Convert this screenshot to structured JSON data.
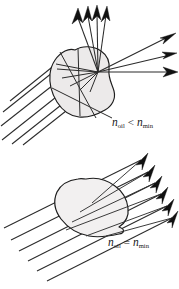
{
  "figure": {
    "name": "refractive-index-matching-diagram",
    "background_color": "#ffffff",
    "ink_color": "#1d1d1d",
    "blob_fill_upper": "#eceaea",
    "blob_fill_lower": "#f2f0f0",
    "width": 179,
    "height": 289
  },
  "panels": [
    {
      "id": "upper",
      "name": "mismatched-index-panel",
      "label": {
        "symbol_left": "n",
        "subscript_left": "oil",
        "operator": "<",
        "symbol_right": "n",
        "subscript_right": "min",
        "full_text": "n_oil < n_min",
        "x": 112,
        "y": 123
      },
      "description": "Light rays entering an irregular particle are refracted and scattered in many directions because the surrounding oil index is lower than the particle index.",
      "incoming_ray_count": 6,
      "outgoing_up_ray_count": 4,
      "outgoing_right_ray_count": 3,
      "rays_deviated": true
    },
    {
      "id": "lower",
      "name": "matched-index-panel",
      "label": {
        "symbol_left": "n",
        "subscript_left": "oil",
        "operator": "=",
        "symbol_right": "n",
        "subscript_right": "min",
        "full_text": "n_oil = n_min",
        "x": 108,
        "y": 243
      },
      "description": "Light rays pass straight through the particle without deviation because the oil index matches the particle index.",
      "incoming_ray_count": 6,
      "outgoing_ray_count": 6,
      "rays_deviated": false
    }
  ]
}
